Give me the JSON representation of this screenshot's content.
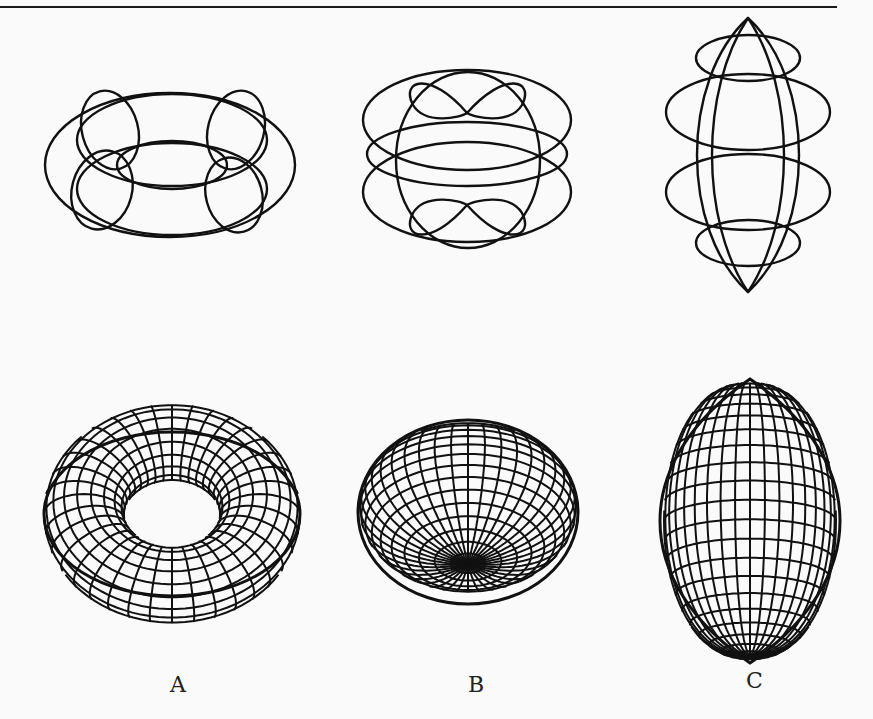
{
  "figure": {
    "ink_color": "#111111",
    "background": "#fafafa",
    "panels": [
      {
        "label": "A",
        "shape": "torus",
        "wire_view": {
          "cx": 170,
          "cy": 165,
          "rings": 4
        },
        "mesh_view": {
          "cx": 172,
          "cy": 514,
          "rx": 128,
          "ry": 82,
          "hole_rx": 48,
          "hole_ry": 16
        }
      },
      {
        "label": "B",
        "shape": "oblate spheroid with dimple",
        "wire_view": {
          "cx": 467,
          "cy": 155
        },
        "mesh_view": {
          "cx": 468,
          "cy": 512,
          "rx": 110,
          "ry": 92
        }
      },
      {
        "label": "C",
        "shape": "prolate lemon / spindle",
        "wire_view": {
          "cx": 748,
          "cy": 155
        },
        "mesh_view": {
          "cx": 750,
          "cy": 521,
          "rx": 88,
          "ry": 142
        }
      }
    ]
  }
}
